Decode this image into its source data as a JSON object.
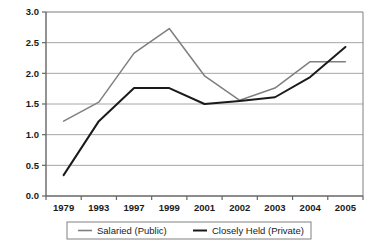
{
  "chart_data": {
    "type": "line",
    "title": "",
    "subtitle": "",
    "xlabel": "",
    "ylabel": "",
    "categories": [
      "1979",
      "1993",
      "1997",
      "1999",
      "2001",
      "2002",
      "2003",
      "2004",
      "2005"
    ],
    "ylim": [
      0.0,
      3.0
    ],
    "yticks": [
      "0.0",
      "0.5",
      "1.0",
      "1.5",
      "2.0",
      "2.5",
      "3.0"
    ],
    "ytick_values": [
      0.0,
      0.5,
      1.0,
      1.5,
      2.0,
      2.5,
      3.0
    ],
    "grid": true,
    "grid_axis": "y",
    "legend_position": "bottom",
    "series": [
      {
        "name": "Salaried (Public)",
        "color": "#7f7f7f",
        "values": [
          1.22,
          1.53,
          2.33,
          2.73,
          1.96,
          1.56,
          1.76,
          2.19,
          2.19
        ]
      },
      {
        "name": "Closely Held (Private)",
        "color": "#1a1a1a",
        "values": [
          0.34,
          1.22,
          1.76,
          1.76,
          1.5,
          1.55,
          1.61,
          1.94,
          2.43
        ]
      }
    ]
  },
  "axis": {
    "y_tick_labels": [
      "3.0",
      "2.5",
      "2.0",
      "1.5",
      "1.0",
      "0.5",
      "0.0"
    ],
    "x_tick_labels": [
      "1979",
      "1993",
      "1997",
      "1999",
      "2001",
      "2002",
      "2003",
      "2004",
      "2005"
    ]
  },
  "legend": {
    "items": [
      {
        "label": "Salaried (Public)",
        "color": "#7f7f7f"
      },
      {
        "label": "Closely Held (Private)",
        "color": "#1a1a1a"
      }
    ]
  },
  "colors": {
    "plot_border": "#808080",
    "gridline": "#a6a6a6",
    "axis": "#666666",
    "background": "#ffffff",
    "series_public": "#7f7f7f",
    "series_private": "#1a1a1a",
    "legend_border": "#808080"
  }
}
